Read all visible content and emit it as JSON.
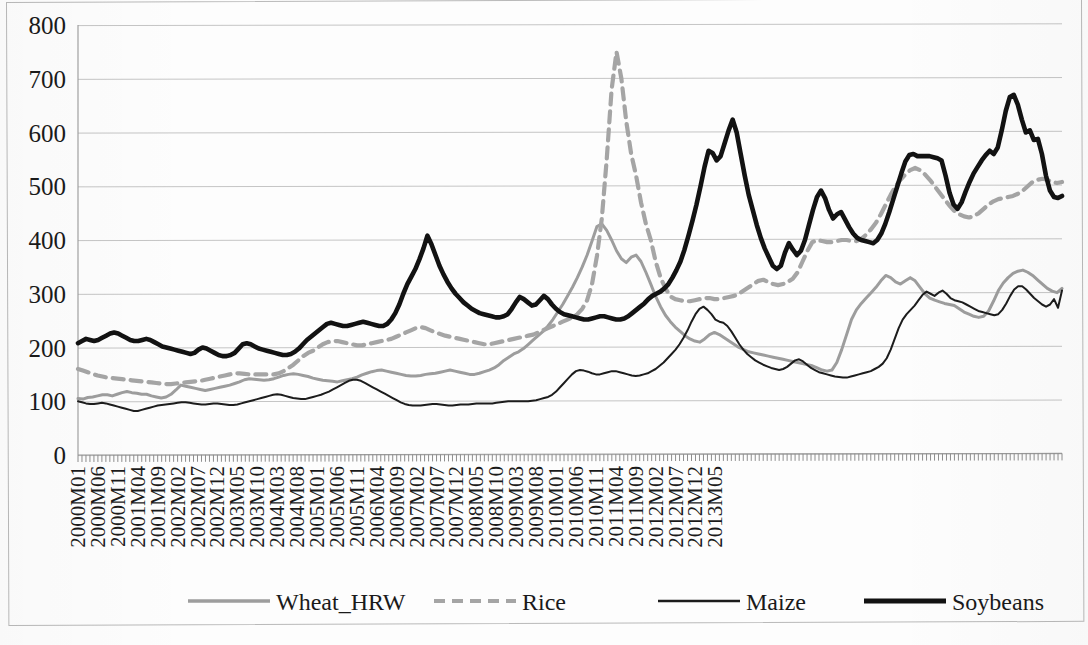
{
  "chart_data": {
    "type": "line",
    "title": "",
    "xlabel": "",
    "ylabel": "",
    "ylim": [
      0,
      800
    ],
    "ytick_values": [
      0,
      100,
      200,
      300,
      400,
      500,
      600,
      700,
      800
    ],
    "ytick_labels": [
      "0",
      "100",
      "200",
      "300",
      "400",
      "500",
      "600",
      "700",
      "800"
    ],
    "grid": true,
    "legend_position": "bottom",
    "x_start": "2000M01",
    "x_end": "2013M05",
    "x_tick_step_months": 5,
    "xtick_labels": [
      "2000M01",
      "2000M06",
      "2000M11",
      "2001M04",
      "2001M09",
      "2002M02",
      "2002M07",
      "2002M12",
      "2003M05",
      "2003M10",
      "2004M03",
      "2004M08",
      "2005M01",
      "2005M06",
      "2005M11",
      "2006M04",
      "2006M09",
      "2007M02",
      "2007M07",
      "2007M12",
      "2008M05",
      "2008M10",
      "2009M03",
      "2009M08",
      "2010M01",
      "2010M06",
      "2010M11",
      "2011M04",
      "2011M09",
      "2012M02",
      "2012M07",
      "2012M12",
      "2013M05"
    ],
    "series": [
      {
        "name": "Wheat_HRW",
        "color": "#9d9d9d",
        "style": "solid",
        "width": 3.0,
        "values": [
          105,
          104,
          107,
          108,
          110,
          112,
          112,
          110,
          113,
          116,
          118,
          116,
          115,
          113,
          113,
          110,
          108,
          106,
          108,
          113,
          121,
          130,
          128,
          126,
          124,
          122,
          120,
          122,
          124,
          126,
          128,
          130,
          133,
          136,
          140,
          142,
          141,
          140,
          139,
          140,
          142,
          145,
          148,
          150,
          151,
          150,
          148,
          146,
          143,
          141,
          139,
          138,
          137,
          136,
          138,
          140,
          142,
          145,
          149,
          152,
          155,
          157,
          158,
          156,
          154,
          152,
          150,
          148,
          147,
          147,
          148,
          150,
          151,
          152,
          154,
          156,
          158,
          156,
          154,
          152,
          150,
          150,
          152,
          155,
          158,
          162,
          168,
          176,
          182,
          188,
          192,
          198,
          206,
          214,
          222,
          230,
          240,
          252,
          266,
          280,
          296,
          312,
          330,
          350,
          372,
          398,
          425,
          430,
          418,
          400,
          380,
          365,
          358,
          368,
          372,
          360,
          340,
          318,
          295,
          276,
          260,
          248,
          238,
          230,
          222,
          216,
          212,
          210,
          216,
          224,
          228,
          224,
          218,
          212,
          206,
          200,
          196,
          192,
          190,
          188,
          186,
          184,
          182,
          180,
          178,
          176,
          174,
          172,
          170,
          168,
          166,
          162,
          158,
          156,
          158,
          172,
          196,
          224,
          252,
          270,
          282,
          292,
          302,
          312,
          324,
          334,
          330,
          322,
          318,
          324,
          330,
          324,
          312,
          300,
          292,
          288,
          285,
          282,
          280,
          278,
          272,
          266,
          262,
          258,
          256,
          258,
          268,
          286,
          306,
          320,
          330,
          338,
          342,
          344,
          340,
          334,
          326,
          318,
          310,
          305,
          302,
          310
        ]
      },
      {
        "name": "Rice",
        "color": "#a5a5a5",
        "style": "dashed",
        "width": 4.2,
        "values": [
          160,
          157,
          154,
          151,
          148,
          146,
          144,
          143,
          142,
          141,
          140,
          139,
          138,
          137,
          136,
          135,
          134,
          133,
          132,
          132,
          133,
          134,
          135,
          136,
          137,
          138,
          140,
          142,
          144,
          146,
          148,
          150,
          152,
          152,
          151,
          150,
          150,
          150,
          150,
          150,
          150,
          152,
          156,
          162,
          168,
          176,
          184,
          190,
          194,
          200,
          206,
          210,
          212,
          212,
          210,
          208,
          206,
          204,
          204,
          206,
          208,
          210,
          212,
          214,
          216,
          220,
          224,
          228,
          232,
          236,
          238,
          236,
          232,
          228,
          225,
          222,
          220,
          218,
          216,
          214,
          212,
          210,
          208,
          206,
          206,
          208,
          210,
          212,
          214,
          216,
          218,
          220,
          222,
          224,
          228,
          232,
          236,
          240,
          244,
          248,
          252,
          256,
          262,
          272,
          288,
          318,
          370,
          440,
          550,
          680,
          750,
          700,
          620,
          560,
          520,
          470,
          430,
          400,
          360,
          330,
          310,
          295,
          290,
          288,
          286,
          286,
          288,
          290,
          292,
          292,
          290,
          290,
          292,
          294,
          296,
          300,
          306,
          312,
          318,
          324,
          326,
          322,
          318,
          316,
          318,
          322,
          328,
          340,
          360,
          380,
          396,
          400,
          398,
          396,
          396,
          398,
          400,
          400,
          398,
          398,
          402,
          410,
          420,
          432,
          448,
          466,
          484,
          500,
          512,
          522,
          530,
          534,
          530,
          522,
          512,
          500,
          488,
          476,
          464,
          454,
          448,
          444,
          442,
          444,
          450,
          458,
          466,
          472,
          476,
          478,
          480,
          482,
          486,
          492,
          500,
          508,
          512,
          514,
          512,
          508,
          506,
          508
        ]
      },
      {
        "name": "Maize",
        "color": "#1c1c1c",
        "style": "solid",
        "width": 2.0,
        "values": [
          100,
          98,
          96,
          95,
          95,
          96,
          97,
          96,
          94,
          92,
          90,
          88,
          86,
          84,
          82,
          82,
          84,
          86,
          88,
          90,
          92,
          93,
          94,
          95,
          96,
          97,
          98,
          98,
          97,
          96,
          95,
          94,
          94,
          95,
          96,
          96,
          95,
          94,
          93,
          93,
          94,
          96,
          98,
          100,
          102,
          104,
          106,
          108,
          110,
          112,
          113,
          112,
          110,
          108,
          106,
          105,
          104,
          104,
          106,
          108,
          110,
          112,
          115,
          118,
          122,
          126,
          130,
          134,
          138,
          140,
          140,
          138,
          134,
          130,
          126,
          122,
          118,
          114,
          110,
          106,
          102,
          98,
          95,
          93,
          92,
          92,
          92,
          93,
          94,
          95,
          95,
          94,
          93,
          92,
          92,
          93,
          94,
          94,
          94,
          95,
          96,
          96,
          96,
          96,
          96,
          97,
          98,
          99,
          100,
          100,
          100,
          100,
          100,
          100,
          101,
          102,
          104,
          106,
          108,
          112,
          118,
          126,
          134,
          142,
          150,
          156,
          158,
          157,
          155,
          152,
          150,
          150,
          152,
          154,
          156,
          156,
          154,
          152,
          150,
          148,
          147,
          148,
          150,
          152,
          156,
          160,
          166,
          172,
          180,
          188,
          196,
          206,
          218,
          232,
          248,
          262,
          272,
          276,
          270,
          262,
          252,
          248,
          246,
          240,
          230,
          218,
          206,
          196,
          188,
          182,
          176,
          172,
          168,
          165,
          162,
          160,
          158,
          160,
          164,
          170,
          176,
          178,
          174,
          168,
          162,
          158,
          154,
          152,
          150,
          148,
          146,
          145,
          144,
          144,
          146,
          148,
          150,
          152,
          154,
          156,
          160,
          164,
          170,
          180,
          196,
          216,
          236,
          252,
          262,
          270,
          278,
          288,
          298,
          304,
          300,
          296,
          302,
          306,
          300,
          292,
          288,
          286,
          284,
          280,
          276,
          272,
          268,
          266,
          264,
          262,
          260,
          262,
          270,
          282,
          296,
          308,
          314,
          314,
          308,
          300,
          292,
          286,
          280,
          276,
          280,
          290,
          274,
          306
        ]
      },
      {
        "name": "Soybeans",
        "color": "#121212",
        "style": "solid",
        "width": 4.6,
        "values": [
          208,
          212,
          216,
          214,
          212,
          214,
          218,
          222,
          226,
          228,
          226,
          222,
          218,
          214,
          212,
          212,
          214,
          216,
          214,
          210,
          206,
          202,
          200,
          198,
          196,
          194,
          192,
          190,
          188,
          190,
          196,
          200,
          198,
          194,
          190,
          186,
          184,
          184,
          186,
          190,
          198,
          206,
          208,
          206,
          202,
          198,
          196,
          194,
          192,
          190,
          188,
          186,
          186,
          188,
          192,
          198,
          206,
          214,
          220,
          226,
          232,
          238,
          244,
          246,
          244,
          242,
          240,
          240,
          242,
          244,
          246,
          248,
          246,
          244,
          242,
          240,
          240,
          244,
          252,
          264,
          280,
          300,
          318,
          332,
          346,
          364,
          384,
          408,
          392,
          372,
          352,
          336,
          322,
          310,
          300,
          292,
          284,
          278,
          272,
          268,
          264,
          262,
          260,
          258,
          256,
          256,
          258,
          262,
          272,
          284,
          294,
          290,
          284,
          278,
          280,
          288,
          296,
          290,
          280,
          272,
          266,
          262,
          260,
          258,
          256,
          254,
          252,
          252,
          254,
          256,
          258,
          258,
          256,
          254,
          252,
          252,
          254,
          258,
          264,
          270,
          276,
          282,
          290,
          296,
          300,
          304,
          310,
          318,
          330,
          344,
          360,
          382,
          408,
          436,
          466,
          500,
          536,
          566,
          562,
          548,
          556,
          580,
          604,
          624,
          600,
          560,
          520,
          484,
          456,
          428,
          404,
          384,
          368,
          352,
          346,
          352,
          376,
          394,
          382,
          372,
          380,
          400,
          428,
          456,
          480,
          492,
          478,
          456,
          440,
          448,
          452,
          438,
          424,
          412,
          404,
          400,
          398,
          396,
          394,
          400,
          412,
          430,
          452,
          476,
          500,
          524,
          546,
          558,
          560,
          556,
          556,
          556,
          556,
          554,
          552,
          548,
          520,
          488,
          466,
          458,
          470,
          490,
          508,
          524,
          536,
          548,
          558,
          566,
          560,
          572,
          604,
          640,
          666,
          670,
          652,
          624,
          600,
          604,
          586,
          588,
          560,
          520,
          492,
          480,
          478,
          482
        ]
      }
    ]
  },
  "legend": {
    "items": [
      {
        "label": "Wheat_HRW",
        "color": "#9d9d9d",
        "style": "solid",
        "width": 3.4
      },
      {
        "label": "Rice",
        "color": "#a5a5a5",
        "style": "dashed",
        "width": 4.2
      },
      {
        "label": "Maize",
        "color": "#1c1c1c",
        "style": "solid",
        "width": 2.4
      },
      {
        "label": "Soybeans",
        "color": "#121212",
        "style": "solid",
        "width": 5.0
      }
    ]
  },
  "bottom_note": ""
}
